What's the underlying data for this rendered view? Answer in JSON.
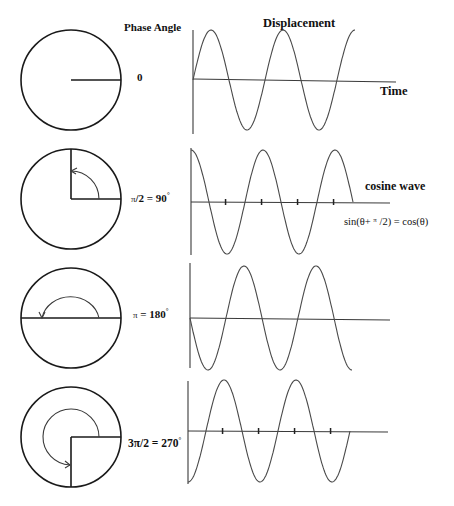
{
  "headers": {
    "phase_angle": "Phase Angle",
    "displacement": "Displacement"
  },
  "panels": [
    {
      "id": "phase-0",
      "phase_degrees": 0,
      "angle_label_parts": [
        "0"
      ],
      "wave": "sine",
      "axis_label": "Time",
      "ticks": false
    },
    {
      "id": "phase-90",
      "phase_degrees": 90,
      "angle_label_parts": [
        "π",
        "/2 = 90",
        "°"
      ],
      "wave": "cosine",
      "wave_label": "cosine wave",
      "equation_parts": [
        "sin(θ+ ",
        "π",
        " /2) = cos(θ)"
      ],
      "ticks": true
    },
    {
      "id": "phase-180",
      "phase_degrees": 180,
      "angle_label_parts": [
        "π",
        " = 180",
        "°"
      ],
      "wave": "negative sine",
      "ticks": false
    },
    {
      "id": "phase-270",
      "phase_degrees": 270,
      "angle_label_parts": [
        "3π/2 = 270",
        "°"
      ],
      "wave": "negative cosine",
      "ticks": true
    }
  ],
  "wave_cycles": 2.25
}
